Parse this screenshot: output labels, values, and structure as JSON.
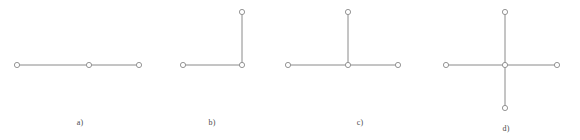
{
  "figure": {
    "title": "",
    "background_color": "#ffffff",
    "edge_color": "#8a8a8a",
    "node_stroke_color": "#8a8a8a",
    "node_fill_color": "#ffffff",
    "caption_color": "#4a4a4a",
    "edge_width": 1,
    "node_radius": 2.6,
    "node_stroke_width": 0.9
  },
  "chart_data": {
    "type": "diagram",
    "title": "",
    "xlabel": "",
    "ylabel": "",
    "xlim": [
      0,
      580
    ],
    "ylim": [
      0,
      140
    ],
    "grid": false,
    "legend": "none",
    "panels": [
      {
        "id": "a",
        "caption": "a)",
        "caption_x": 80,
        "caption_y": 118,
        "node_count": 3,
        "edge_count": 2,
        "shape": "path-3",
        "nodes": [
          {
            "id": "a1",
            "x": 17,
            "y": 65
          },
          {
            "id": "a2",
            "x": 89,
            "y": 65
          },
          {
            "id": "a3",
            "x": 139,
            "y": 65
          }
        ],
        "edges": [
          {
            "from": "a1",
            "to": "a2"
          },
          {
            "from": "a2",
            "to": "a3"
          }
        ]
      },
      {
        "id": "b",
        "caption": "b)",
        "caption_x": 212,
        "caption_y": 118,
        "node_count": 3,
        "edge_count": 2,
        "shape": "elbow-3",
        "nodes": [
          {
            "id": "b1",
            "x": 183,
            "y": 65
          },
          {
            "id": "b2",
            "x": 242,
            "y": 65
          },
          {
            "id": "b3",
            "x": 242,
            "y": 12
          }
        ],
        "edges": [
          {
            "from": "b1",
            "to": "b2"
          },
          {
            "from": "b2",
            "to": "b3"
          }
        ]
      },
      {
        "id": "c",
        "caption": "c)",
        "caption_x": 360,
        "caption_y": 118,
        "node_count": 4,
        "edge_count": 3,
        "shape": "star-3",
        "nodes": [
          {
            "id": "c0",
            "x": 348,
            "y": 65
          },
          {
            "id": "c1",
            "x": 288,
            "y": 65
          },
          {
            "id": "c2",
            "x": 398,
            "y": 65
          },
          {
            "id": "c3",
            "x": 348,
            "y": 12
          }
        ],
        "edges": [
          {
            "from": "c0",
            "to": "c1"
          },
          {
            "from": "c0",
            "to": "c2"
          },
          {
            "from": "c0",
            "to": "c3"
          }
        ]
      },
      {
        "id": "d",
        "caption": "d)",
        "caption_x": 506,
        "caption_y": 124,
        "node_count": 5,
        "edge_count": 4,
        "shape": "star-4",
        "nodes": [
          {
            "id": "d0",
            "x": 505,
            "y": 65
          },
          {
            "id": "d1",
            "x": 446,
            "y": 65
          },
          {
            "id": "d2",
            "x": 557,
            "y": 65
          },
          {
            "id": "d3",
            "x": 505,
            "y": 12
          },
          {
            "id": "d4",
            "x": 505,
            "y": 108
          }
        ],
        "edges": [
          {
            "from": "d0",
            "to": "d1"
          },
          {
            "from": "d0",
            "to": "d2"
          },
          {
            "from": "d0",
            "to": "d3"
          },
          {
            "from": "d0",
            "to": "d4"
          }
        ]
      }
    ]
  }
}
